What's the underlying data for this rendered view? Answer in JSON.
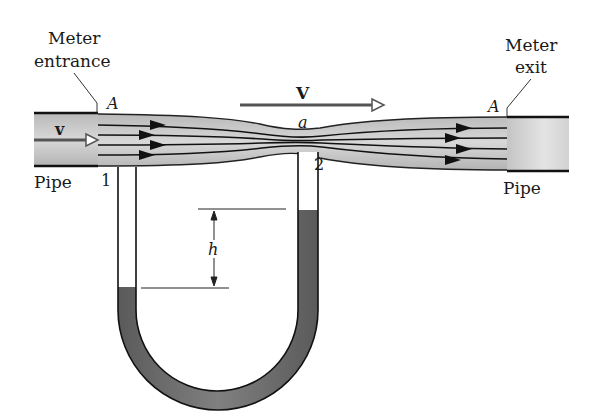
{
  "figure": {
    "labels": {
      "meter_entrance": [
        "Meter",
        "entrance"
      ],
      "meter_exit": [
        "Meter",
        "exit"
      ],
      "entrance_area": "A",
      "exit_area": "A",
      "throat_area": "a",
      "pipe_left": "Pipe",
      "pipe_right": "Pipe",
      "pipe_velocity": "v",
      "throat_velocity": "V",
      "tap_1": "1",
      "tap_2": "2",
      "height_difference": "h"
    },
    "colors": {
      "pipe_fill": "#c8c8c8",
      "pipe_outline": "#1a1a1a",
      "fluid_fill": "#6e6e6e",
      "tube_fill": "#ffffff",
      "background": "#ffffff"
    },
    "streamlines": 4
  }
}
